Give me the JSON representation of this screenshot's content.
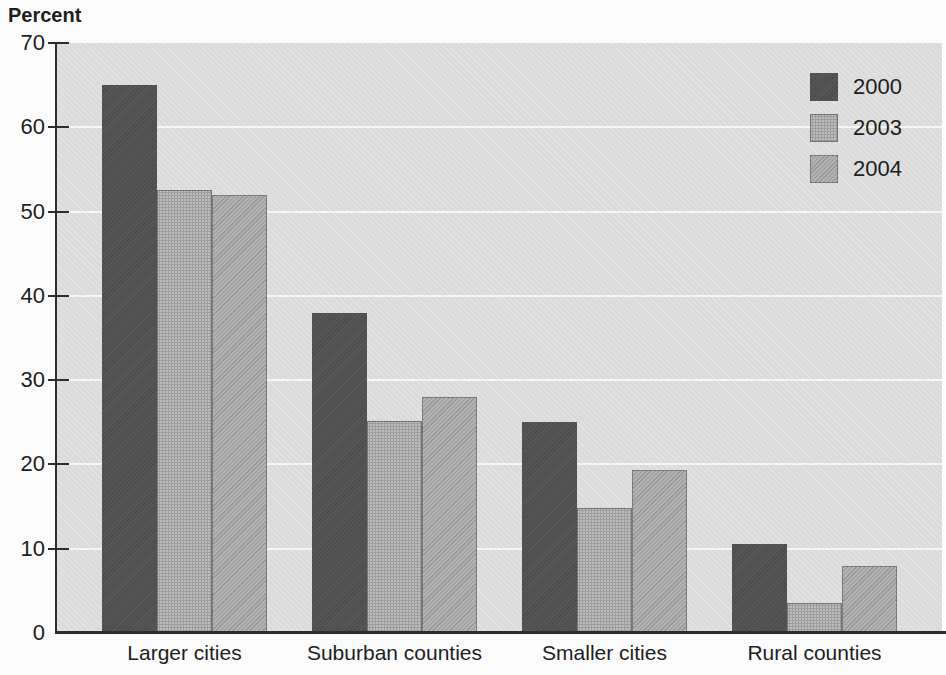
{
  "chart_data": {
    "type": "bar",
    "title": "",
    "ylabel": "Percent",
    "xlabel": "",
    "ylim": [
      0,
      70
    ],
    "ytick_step": 10,
    "yticks": [
      70,
      60,
      50,
      40,
      30,
      20,
      10,
      0
    ],
    "grid": true,
    "legend_position": "top-right",
    "categories": [
      "Larger cities",
      "Suburban counties",
      "Smaller cities",
      "Rural counties"
    ],
    "series": [
      {
        "name": "2000",
        "color": "#4f4f4f",
        "values": [
          65,
          38,
          25,
          10.5
        ]
      },
      {
        "name": "2003",
        "color": "#bdbdbd",
        "values": [
          52.5,
          25.2,
          14.8,
          3.5
        ]
      },
      {
        "name": "2004",
        "color": "#b1b1b1",
        "values": [
          52,
          28,
          19.3,
          8
        ]
      }
    ]
  },
  "colors": {
    "plot_background": "#dedede",
    "gridline": "#f8f8f8",
    "axis": "#2d2d2d",
    "text": "#1e1e1e"
  }
}
